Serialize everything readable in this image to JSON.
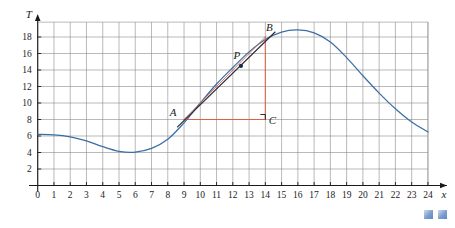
{
  "chart_data": {
    "type": "line",
    "title": "",
    "xlabel": "x",
    "ylabel": "T",
    "xlim": [
      0,
      25
    ],
    "ylim": [
      0,
      19.8
    ],
    "grid": true,
    "legend": false,
    "x_ticks": [
      0,
      1,
      2,
      3,
      4,
      5,
      6,
      7,
      8,
      9,
      10,
      11,
      12,
      13,
      14,
      15,
      16,
      17,
      18,
      19,
      20,
      21,
      22,
      23,
      24
    ],
    "x_tick_labels": [
      "0",
      "1",
      "2",
      "3",
      "4",
      "5",
      "6",
      "7",
      "8",
      "9",
      "10",
      "11",
      "12",
      "13",
      "14",
      "15",
      "16",
      "17",
      "18",
      "19",
      "20",
      "21",
      "22",
      "23",
      "24"
    ],
    "y_ticks": [
      2,
      4,
      6,
      8,
      10,
      12,
      14,
      16,
      18
    ],
    "y_tick_labels": [
      "2",
      "4",
      "6",
      "8",
      "10",
      "12",
      "14",
      "16",
      "18"
    ],
    "series": [
      {
        "name": "temperature-curve",
        "color": "#3b6ea5",
        "x": [
          0,
          1,
          2,
          3,
          4,
          5,
          6,
          7,
          8,
          9,
          10,
          11,
          12,
          13,
          14,
          15,
          16,
          17,
          18,
          19,
          20,
          21,
          22,
          23,
          24
        ],
        "y": [
          6.2,
          6.15,
          5.9,
          5.4,
          4.7,
          4.15,
          4.05,
          4.5,
          5.6,
          7.6,
          10.0,
          12.3,
          14.3,
          16.2,
          17.7,
          18.6,
          18.85,
          18.5,
          17.4,
          15.5,
          13.3,
          11.2,
          9.3,
          7.7,
          6.5
        ]
      }
    ],
    "annotations": {
      "points": [
        {
          "label": "A",
          "x": 9,
          "y": 8,
          "label_dx": -11,
          "label_dy": -4,
          "dot": false
        },
        {
          "label": "P",
          "x": 12.5,
          "y": 14.5,
          "label_dx": -4,
          "label_dy": -7,
          "dot": true
        },
        {
          "label": "B",
          "x": 14,
          "y": 18,
          "label_dx": 4,
          "label_dy": -6,
          "dot": false
        },
        {
          "label": "C",
          "x": 14,
          "y": 8,
          "label_dx": 7,
          "label_dy": 4,
          "dot": false
        }
      ],
      "secant": {
        "name": "secant-line-AB",
        "from": [
          9,
          8
        ],
        "to": [
          14,
          18
        ],
        "color": "#d4674f"
      },
      "tangent": {
        "name": "tangent-line-at-P",
        "from": [
          8.6,
          7.1
        ],
        "to": [
          14.6,
          18.6
        ],
        "color": "#2d2d3a"
      },
      "leg_horizontal": {
        "name": "leg-AC",
        "from": [
          9,
          8
        ],
        "to": [
          14,
          8
        ],
        "color": "#e2543a"
      },
      "leg_vertical": {
        "name": "leg-BC",
        "from": [
          14,
          8
        ],
        "to": [
          14,
          18
        ],
        "color": "#e2543a"
      },
      "right_angle_marker": {
        "name": "right-angle-marker-at-C",
        "x": 14,
        "y": 8,
        "size": 5
      }
    },
    "colors": {
      "curve": "#3b6ea5",
      "grid": "#8c8c8c",
      "axis": "#1a1a1a",
      "secant": "#d4674f",
      "tangent": "#2d2d3a",
      "legs": "#e2543a",
      "decoration": "#6f94cd"
    }
  },
  "decorations": {
    "squares": [
      {
        "name": "decorative-square-left"
      },
      {
        "name": "decorative-square-right"
      }
    ]
  }
}
